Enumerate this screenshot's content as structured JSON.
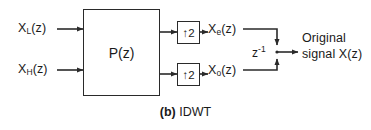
{
  "figure": {
    "caption_prefix": "(b)",
    "caption_text": "IDWT"
  },
  "inputs": {
    "low_main": "X",
    "low_sub": "L",
    "low_suffix": "(z)",
    "high_main": "X",
    "high_sub": "H",
    "high_suffix": "(z)"
  },
  "blocks": {
    "polyphase_label": "P(z)",
    "upsampler_even_label": "↑2",
    "upsampler_odd_label": "↑2"
  },
  "signals": {
    "even_main": "X",
    "even_sub": "e",
    "even_suffix": "(z)",
    "odd_main": "X",
    "odd_sub": "o",
    "odd_suffix": "(z)",
    "delay_main": "z",
    "delay_sup": "-1"
  },
  "output": {
    "line1": "Original",
    "line2": "signal X(z)"
  },
  "colors": {
    "stroke": "#2a2a2a",
    "text": "#1a1a1a",
    "background": "#ffffff"
  }
}
